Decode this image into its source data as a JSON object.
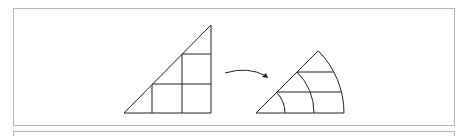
{
  "figure": {
    "left_shape": "grid-triangle",
    "arrow": "curved-arrow-right",
    "right_shape": "polar-sector",
    "stroke_color": "#222222",
    "frame_color": "#b5b5b5"
  }
}
